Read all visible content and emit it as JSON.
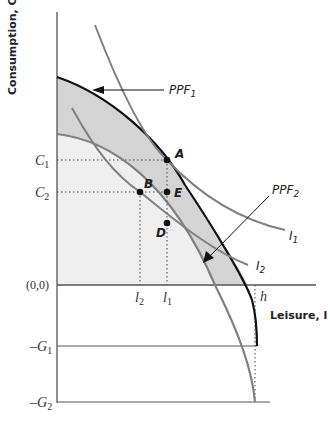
{
  "diagram": {
    "y_axis_label": "Consumption, C",
    "x_axis_label": "Leisure, l",
    "origin_label": "(0,0)",
    "y_ticks": {
      "C1": {
        "main": "C",
        "sub": "1"
      },
      "C2": {
        "main": "C",
        "sub": "2"
      },
      "G1": {
        "main": "–G",
        "sub": "1"
      },
      "G2": {
        "main": "–G",
        "sub": "2"
      }
    },
    "x_ticks": {
      "l2": {
        "main": "l",
        "sub": "2"
      },
      "l1": {
        "main": "l",
        "sub": "1"
      },
      "h": {
        "main": "h"
      }
    },
    "points": {
      "A": "A",
      "B": "B",
      "D": "D",
      "E": "E"
    },
    "curves": {
      "ppf1": {
        "main": "PPF",
        "sub": "1"
      },
      "ppf2": {
        "main": "PPF",
        "sub": "2"
      },
      "i1": {
        "main": "I",
        "sub": "1"
      },
      "i2": {
        "main": "I",
        "sub": "2"
      }
    },
    "colors": {
      "ppf1": "#111111",
      "ppf2": "#808080",
      "indifference": "#808080",
      "shaded_band": "#d4d4d4",
      "feasible_region": "#efefef",
      "axis": "#555555"
    }
  }
}
